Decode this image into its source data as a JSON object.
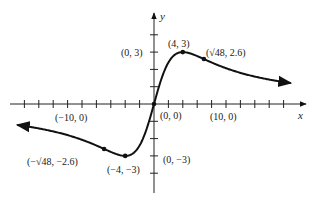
{
  "chart_data": {
    "type": "line",
    "title": "",
    "xlabel": "x",
    "ylabel": "y",
    "function_shape": "odd rational curve rising from origin to max at (4, 3), min at (-4, -3), approaching 0 as |x| grows",
    "x_tick_step": 2,
    "y_tick_step": 1,
    "xlim": [
      -19,
      20
    ],
    "ylim": [
      -5,
      5
    ],
    "grid": false,
    "series": [
      {
        "name": "curve",
        "points": [
          {
            "x": -19,
            "y": -1.21
          },
          {
            "x": -12,
            "y": -1.8
          },
          {
            "x": -6.93,
            "y": -2.6
          },
          {
            "x": -4,
            "y": -3
          },
          {
            "x": -2,
            "y": -2.4
          },
          {
            "x": 0,
            "y": 0
          },
          {
            "x": 2,
            "y": 2.4
          },
          {
            "x": 4,
            "y": 3
          },
          {
            "x": 6.93,
            "y": 2.6
          },
          {
            "x": 12,
            "y": 1.8
          },
          {
            "x": 19,
            "y": 1.21
          }
        ]
      }
    ],
    "marked_points": [
      {
        "x": 0,
        "y": 0,
        "label": "(0, 0)"
      },
      {
        "x": 4,
        "y": 3,
        "label": "(4, 3)"
      },
      {
        "x": 6.93,
        "y": 2.6,
        "label": "(√48, 2.6)"
      },
      {
        "x": -4,
        "y": -3,
        "label": "(−4, −3)"
      },
      {
        "x": -6.93,
        "y": -2.6,
        "label": "(−√48, −2.6)"
      }
    ],
    "annotations": [
      {
        "label": "(0, 3)",
        "at": {
          "x": 0,
          "y": 3
        }
      },
      {
        "label": "(0, −3)",
        "at": {
          "x": 0,
          "y": -3
        }
      },
      {
        "label": "(10, 0)",
        "at": {
          "x": 10,
          "y": 0
        }
      },
      {
        "label": "(−10, 0)",
        "at": {
          "x": -10,
          "y": 0
        }
      }
    ]
  },
  "labels": {
    "y_axis": "y",
    "x_axis": "x",
    "origin": "(0, 0)",
    "y_pos3": "(0, 3)",
    "y_neg3": "(0, −3)",
    "x_pos10": "(10, 0)",
    "x_neg10": "(−10, 0)",
    "max": "(4, 3)",
    "inflect_pos": "(√48, 2.6)",
    "min": "(−4, −3)",
    "inflect_neg": "(−√48, −2.6)"
  }
}
